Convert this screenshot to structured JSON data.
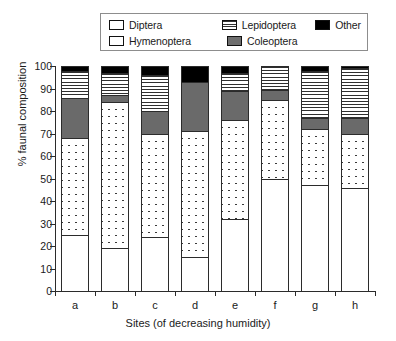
{
  "legend": {
    "entries": [
      {
        "name": "Diptera",
        "pattern": "crosshatch"
      },
      {
        "name": "Lepidoptera",
        "pattern": "horizontal-lines"
      },
      {
        "name": "Other",
        "pattern": "solid-black"
      },
      {
        "name": "Hymenoptera",
        "pattern": "white"
      },
      {
        "name": "Coleoptera",
        "pattern": "solid-gray"
      }
    ]
  },
  "chart_data": {
    "type": "bar",
    "subtype": "stacked-100-percent",
    "title": "",
    "xlabel": "Sites (of decreasing humidity)",
    "ylabel": "% faunal composition",
    "categories": [
      "a",
      "b",
      "c",
      "d",
      "e",
      "f",
      "g",
      "h"
    ],
    "ylim": [
      0,
      100
    ],
    "yticks": [
      0,
      10,
      20,
      30,
      40,
      50,
      60,
      70,
      80,
      90,
      100
    ],
    "grid": false,
    "legend_position": "top",
    "series": [
      {
        "name": "Hymenoptera",
        "pattern": "white",
        "color": "#ffffff",
        "values": [
          25,
          19,
          24,
          15,
          32,
          50,
          47,
          46
        ]
      },
      {
        "name": "Diptera",
        "pattern": "crosshatch",
        "color": "#ffffff",
        "values": [
          43,
          65,
          46,
          56,
          44,
          35,
          25,
          24
        ]
      },
      {
        "name": "Coleoptera",
        "pattern": "solid-gray",
        "color": "#6a6a6a",
        "values": [
          18,
          3,
          10,
          22,
          13,
          4.5,
          5,
          7
        ]
      },
      {
        "name": "Lepidoptera",
        "pattern": "horizontal-lines",
        "color": "#ffffff",
        "values": [
          12,
          10,
          16,
          0,
          8,
          10.5,
          21,
          22
        ]
      },
      {
        "name": "Other",
        "pattern": "solid-black",
        "color": "#000000",
        "values": [
          2,
          3,
          4,
          7,
          3,
          0,
          2,
          1
        ]
      }
    ],
    "cumulative_tops": {
      "a": {
        "Hymenoptera": 25,
        "Diptera": 68,
        "Coleoptera": 86,
        "Lepidoptera": 98,
        "Other": 100
      },
      "b": {
        "Hymenoptera": 19,
        "Diptera": 84,
        "Coleoptera": 87,
        "Lepidoptera": 97,
        "Other": 100
      },
      "c": {
        "Hymenoptera": 24,
        "Diptera": 70,
        "Coleoptera": 80,
        "Lepidoptera": 96,
        "Other": 100
      },
      "d": {
        "Hymenoptera": 15,
        "Diptera": 71,
        "Coleoptera": 93,
        "Lepidoptera": 93,
        "Other": 100
      },
      "e": {
        "Hymenoptera": 32,
        "Diptera": 76,
        "Coleoptera": 89,
        "Lepidoptera": 97,
        "Other": 100
      },
      "f": {
        "Hymenoptera": 50,
        "Diptera": 85,
        "Coleoptera": 89.5,
        "Lepidoptera": 100,
        "Other": 100
      },
      "g": {
        "Hymenoptera": 47,
        "Diptera": 72,
        "Coleoptera": 77,
        "Lepidoptera": 98,
        "Other": 100
      },
      "h": {
        "Hymenoptera": 46,
        "Diptera": 70,
        "Coleoptera": 77,
        "Lepidoptera": 99,
        "Other": 100
      }
    }
  }
}
